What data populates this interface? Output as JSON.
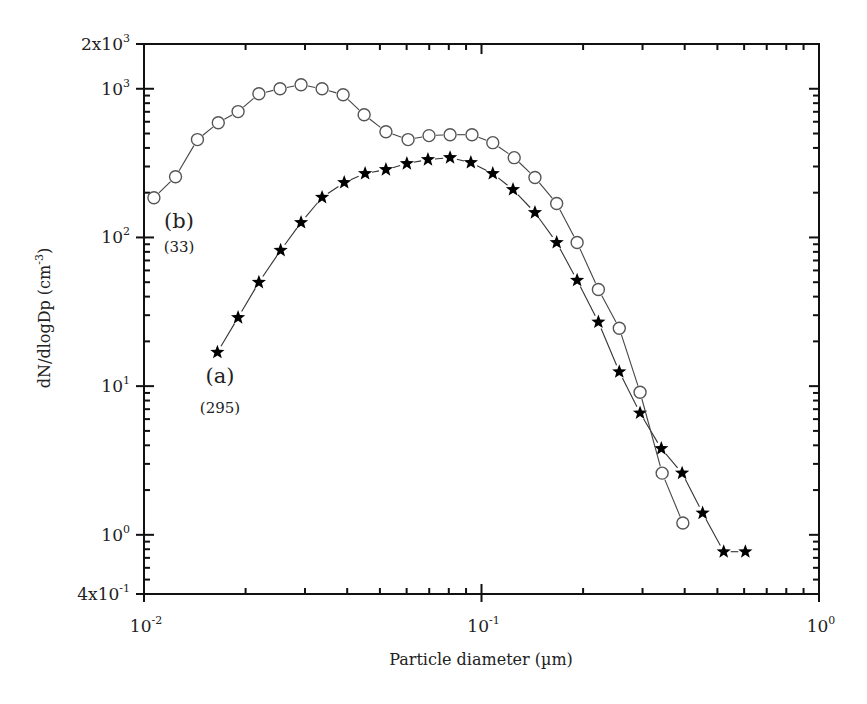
{
  "chart_data": {
    "type": "line",
    "title": "",
    "xlabel": "Particle diameter (µm)",
    "ylabel": "dN/dlogDp (cm-3)",
    "ylabel_parts": {
      "base": "dN/dlogDp (cm",
      "sup": "-3",
      "close": ")"
    },
    "xscale": "log",
    "yscale": "log",
    "xlim": [
      0.01,
      1
    ],
    "ylim": [
      0.4,
      2000
    ],
    "grid": false,
    "legend": "inline annotations",
    "x_ticks": [
      {
        "value": 0.01,
        "base": "10",
        "sup": "-2"
      },
      {
        "value": 0.1,
        "base": "10",
        "sup": "-1"
      },
      {
        "value": 1,
        "base": "10",
        "sup": "0"
      }
    ],
    "y_ticks": [
      {
        "value": 0.4,
        "base": "4x10",
        "sup": "-1"
      },
      {
        "value": 1,
        "base": "10",
        "sup": "0"
      },
      {
        "value": 10,
        "base": "10",
        "sup": "1"
      },
      {
        "value": 100,
        "base": "10",
        "sup": "2"
      },
      {
        "value": 1000,
        "base": "10",
        "sup": "3"
      },
      {
        "value": 2000,
        "base": "2x10",
        "sup": "3"
      }
    ],
    "series": [
      {
        "name": "(a)",
        "count_label": "(295)",
        "marker": "filled-star",
        "color": "#000000",
        "label_pos": {
          "x": 0.0168,
          "y": 10.5
        },
        "count_pos": {
          "x": 0.0168,
          "y": 6.6
        },
        "x": [
          0.0165,
          0.019,
          0.0219,
          0.0254,
          0.0292,
          0.0337,
          0.0392,
          0.0452,
          0.0521,
          0.0601,
          0.0694,
          0.0807,
          0.093,
          0.108,
          0.124,
          0.144,
          0.167,
          0.192,
          0.222,
          0.256,
          0.295,
          0.341,
          0.393,
          0.452,
          0.522,
          0.605
        ],
        "y": [
          16.9,
          28.9,
          49.9,
          81.9,
          126,
          186,
          234,
          269,
          286,
          314,
          334,
          344,
          319,
          269,
          210,
          147,
          92.5,
          51.5,
          27.0,
          12.5,
          6.6,
          3.8,
          2.6,
          1.4,
          0.77,
          0.77
        ]
      },
      {
        "name": "(b)",
        "count_label": "(33)",
        "marker": "open-circle",
        "color": "#555555",
        "label_pos": {
          "x": 0.0127,
          "y": 115
        },
        "count_pos": {
          "x": 0.0127,
          "y": 80
        },
        "x": [
          0.0107,
          0.0124,
          0.0144,
          0.0166,
          0.019,
          0.0219,
          0.0253,
          0.0292,
          0.0337,
          0.0389,
          0.0449,
          0.0521,
          0.0606,
          0.0699,
          0.0807,
          0.0937,
          0.108,
          0.125,
          0.144,
          0.167,
          0.192,
          0.222,
          0.256,
          0.295,
          0.343,
          0.395
        ],
        "y": [
          185,
          256,
          455,
          591,
          702,
          925,
          1000,
          1064,
          1000,
          911,
          669,
          514,
          455,
          484,
          491,
          491,
          434,
          344,
          253,
          169,
          92.5,
          44.7,
          24.5,
          9.1,
          2.6,
          1.2
        ]
      }
    ]
  }
}
